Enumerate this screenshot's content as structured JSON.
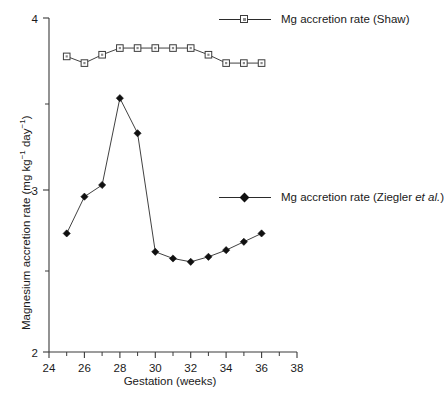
{
  "chart_data": {
    "type": "line",
    "title": "",
    "subtitle": "",
    "xlabel": "Gestation (weeks)",
    "ylabel": "Magnesium accretion rate (mg kg⁻¹ day⁻¹)",
    "ylabel_parts": {
      "prefix": "Magnesium accretion rate (mg kg",
      "sup1": "−1",
      "middle": " day",
      "sup2": "−1",
      "suffix": ")"
    },
    "xlim": [
      24,
      38
    ],
    "ylim": [
      2,
      4
    ],
    "x_ticks_major": [
      24,
      26,
      28,
      30,
      32,
      34,
      36,
      38
    ],
    "x_ticks_minor": [
      25,
      27,
      29,
      31,
      33,
      35,
      37
    ],
    "y_ticks_major": [
      2,
      3,
      4
    ],
    "y_ticks_minor": [
      2.5,
      3.5
    ],
    "x_tick_labels": [
      "24",
      "26",
      "28",
      "30",
      "32",
      "34",
      "36",
      "38"
    ],
    "y_tick_labels": [
      "2",
      "3",
      "4"
    ],
    "grid": false,
    "legend_position": "inside-right",
    "series": [
      {
        "name": "Mg accretion rate (Shaw)",
        "marker": "open-square",
        "color": "#3c3c3c",
        "x": [
          25,
          26,
          27,
          28,
          29,
          30,
          31,
          32,
          33,
          34,
          35,
          36
        ],
        "values": [
          3.77,
          3.73,
          3.78,
          3.82,
          3.82,
          3.82,
          3.82,
          3.82,
          3.78,
          3.73,
          3.73,
          3.73
        ]
      },
      {
        "name": "Mg accretion rate (Ziegler et al.)",
        "marker": "filled-diamond",
        "color": "#101010",
        "x": [
          25,
          26,
          27,
          28,
          29,
          30,
          31,
          32,
          33,
          34,
          35,
          36
        ],
        "values": [
          2.71,
          2.93,
          3.0,
          3.52,
          3.31,
          2.6,
          2.56,
          2.54,
          2.57,
          2.61,
          2.66,
          2.71
        ]
      }
    ]
  },
  "legend": {
    "entries": [
      {
        "label": "Mg accretion rate (Shaw)",
        "marker": "open-square"
      },
      {
        "label_prefix": "Mg accretion rate (Ziegler ",
        "label_italic": "et al.",
        "label_suffix": ")",
        "marker": "filled-diamond"
      }
    ]
  },
  "axes": {
    "x_title": "Gestation (weeks)"
  }
}
